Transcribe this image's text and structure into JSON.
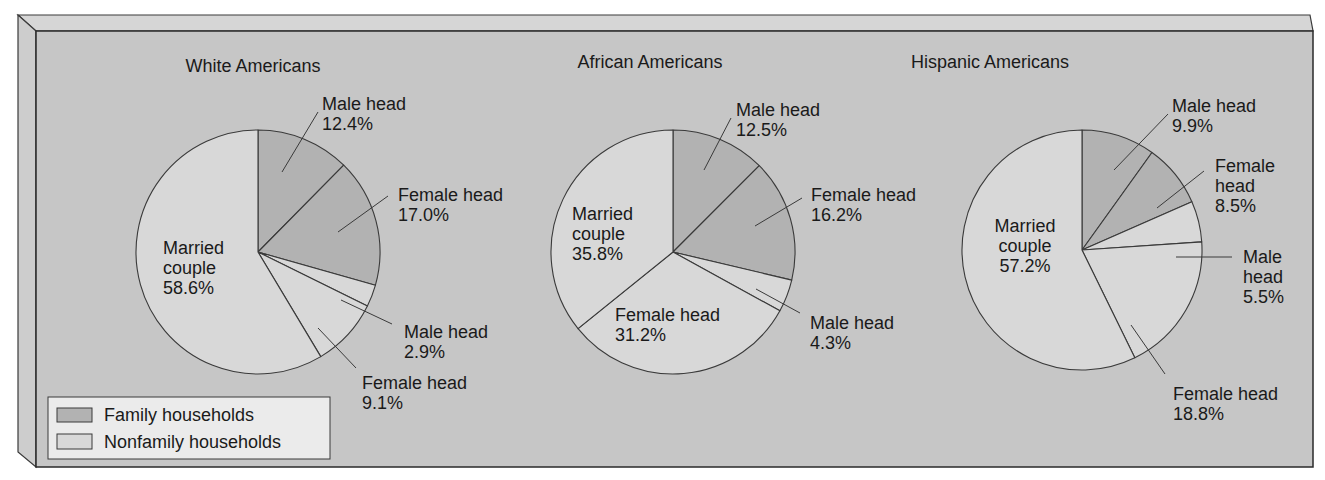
{
  "colors": {
    "page_bg": "#ffffff",
    "panel_bg": "#c6c6c6",
    "bevel_top": "#d8d8d8",
    "bevel_left": "#d0d0d0",
    "family": "#b2b2b2",
    "nonfamily": "#d8d8d8",
    "legend_bg": "#ebebeb",
    "stroke": "#3a3a3a",
    "text": "#1a1a1a"
  },
  "legend": {
    "items": [
      {
        "label": "Family households",
        "category": "family"
      },
      {
        "label": "Nonfamily households",
        "category": "nonfamily"
      }
    ]
  },
  "chart_data": [
    {
      "type": "pie",
      "title": "White Americans",
      "legend": [
        "Family households",
        "Nonfamily households"
      ],
      "slices": [
        {
          "label": "Male head",
          "value": 12.4,
          "category": "family"
        },
        {
          "label": "Female head",
          "value": 17.0,
          "category": "family"
        },
        {
          "label": "Male head",
          "value": 2.9,
          "category": "nonfamily"
        },
        {
          "label": "Female head",
          "value": 9.1,
          "category": "nonfamily"
        },
        {
          "label": "Married couple",
          "value": 58.6,
          "category": "nonfamily"
        }
      ]
    },
    {
      "type": "pie",
      "title": "African Americans",
      "legend": [
        "Family households",
        "Nonfamily households"
      ],
      "slices": [
        {
          "label": "Male head",
          "value": 12.5,
          "category": "family"
        },
        {
          "label": "Female head",
          "value": 16.2,
          "category": "family"
        },
        {
          "label": "Male head",
          "value": 4.3,
          "category": "nonfamily"
        },
        {
          "label": "Female head",
          "value": 31.2,
          "category": "nonfamily"
        },
        {
          "label": "Married couple",
          "value": 35.8,
          "category": "nonfamily"
        }
      ]
    },
    {
      "type": "pie",
      "title": "Hispanic Americans",
      "legend": [
        "Family households",
        "Nonfamily households"
      ],
      "slices": [
        {
          "label": "Male head",
          "value": 9.9,
          "category": "family"
        },
        {
          "label": "Female head",
          "value": 8.5,
          "category": "family"
        },
        {
          "label": "Male head",
          "value": 5.5,
          "category": "nonfamily"
        },
        {
          "label": "Female head",
          "value": 18.8,
          "category": "nonfamily"
        },
        {
          "label": "Married couple",
          "value": 57.2,
          "category": "nonfamily"
        }
      ]
    }
  ],
  "pies": [
    {
      "name": "pie-white-americans",
      "cx": 258,
      "cy": 252,
      "r": 122,
      "title_pos": {
        "x": 253,
        "y": 72
      },
      "labels": [
        {
          "lines": [
            "Male head",
            "12.4%"
          ],
          "x": 322,
          "y": 110,
          "anchor": "start",
          "leader": [
            [
              282,
              172
            ],
            [
              318,
              112
            ]
          ]
        },
        {
          "lines": [
            "Female head",
            "17.0%"
          ],
          "x": 398,
          "y": 201,
          "anchor": "start",
          "leader": [
            [
              338,
              232
            ],
            [
              388,
              196
            ]
          ]
        },
        {
          "lines": [
            "Male head",
            "2.9%"
          ],
          "x": 404,
          "y": 338,
          "anchor": "start",
          "leader": [
            [
              341,
              300
            ],
            [
              392,
              324
            ]
          ]
        },
        {
          "lines": [
            "Female head",
            "9.1%"
          ],
          "x": 362,
          "y": 389,
          "anchor": "start",
          "leader": [
            [
              318,
              328
            ],
            [
              356,
              368
            ]
          ]
        },
        {
          "lines": [
            "Married",
            "couple",
            "58.6%"
          ],
          "x": 163,
          "y": 254,
          "anchor": "start",
          "leader": null
        }
      ]
    },
    {
      "name": "pie-african-americans",
      "cx": 673,
      "cy": 252,
      "r": 122,
      "title_pos": {
        "x": 650,
        "y": 68
      },
      "labels": [
        {
          "lines": [
            "Male head",
            "12.5%"
          ],
          "x": 736,
          "y": 116,
          "anchor": "start",
          "leader": [
            [
              704,
              170
            ],
            [
              731,
              118
            ]
          ]
        },
        {
          "lines": [
            "Female head",
            "16.2%"
          ],
          "x": 811,
          "y": 201,
          "anchor": "start",
          "leader": [
            [
              755,
              226
            ],
            [
              802,
              198
            ]
          ]
        },
        {
          "lines": [
            "Male head",
            "4.3%"
          ],
          "x": 810,
          "y": 329,
          "anchor": "start",
          "leader": [
            [
              756,
              289
            ],
            [
              800,
              313
            ]
          ]
        },
        {
          "lines": [
            "Female head",
            "31.2%"
          ],
          "x": 615,
          "y": 321,
          "anchor": "start",
          "leader": null
        },
        {
          "lines": [
            "Married",
            "couple",
            "35.8%"
          ],
          "x": 572,
          "y": 220,
          "anchor": "start",
          "leader": null
        }
      ]
    },
    {
      "name": "pie-hispanic-americans",
      "cx": 1082,
      "cy": 250,
      "r": 120,
      "title_pos": {
        "x": 990,
        "y": 68
      },
      "labels": [
        {
          "lines": [
            "Male head",
            "9.9%"
          ],
          "x": 1172,
          "y": 112,
          "anchor": "start",
          "leader": [
            [
              1114,
              170
            ],
            [
              1168,
              114
            ]
          ]
        },
        {
          "lines": [
            "Female head",
            "8.5%"
          ],
          "x": 1215,
          "y": 172,
          "anchor": "start",
          "stacked": [
            "Female",
            "head",
            "8.5%"
          ],
          "leader": [
            [
              1157,
              208
            ],
            [
              1204,
              171
            ]
          ]
        },
        {
          "lines": [
            "Male head",
            "5.5%"
          ],
          "x": 1243,
          "y": 263,
          "anchor": "start",
          "stacked": [
            "Male",
            "head",
            "5.5%"
          ],
          "leader": [
            [
              1176,
              257
            ],
            [
              1232,
              257
            ]
          ]
        },
        {
          "lines": [
            "Female head",
            "18.8%"
          ],
          "x": 1173,
          "y": 400,
          "anchor": "start",
          "leader": [
            [
              1131,
              325
            ],
            [
              1165,
              374
            ]
          ]
        },
        {
          "lines": [
            "Married",
            "couple",
            "57.2%"
          ],
          "x": 1025,
          "y": 232,
          "anchor": "middle",
          "leader": null
        }
      ]
    }
  ]
}
